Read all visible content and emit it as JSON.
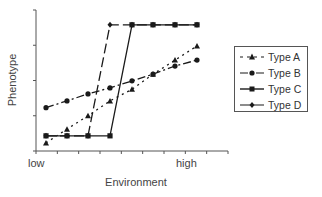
{
  "chart_data": {
    "type": "line",
    "title": "",
    "xlabel": "Environment",
    "ylabel": "Phenotype",
    "x_tick_labels": [
      "low",
      "high"
    ],
    "x": [
      1,
      2,
      3,
      4,
      5,
      6,
      7,
      8
    ],
    "ylim": [
      0,
      4
    ],
    "grid": false,
    "legend_position": "right",
    "series": [
      {
        "name": "Type A",
        "marker": "triangle",
        "line_style": "dotted",
        "values": [
          0.23,
          0.62,
          1.0,
          1.42,
          1.75,
          2.18,
          2.58,
          2.98
        ]
      },
      {
        "name": "Type B",
        "marker": "circle",
        "line_style": "dash-dot",
        "values": [
          1.23,
          1.42,
          1.62,
          1.79,
          1.99,
          2.18,
          2.41,
          2.58
        ]
      },
      {
        "name": "Type C",
        "marker": "square",
        "line_style": "solid",
        "values": [
          0.43,
          0.43,
          0.43,
          0.43,
          3.58,
          3.58,
          3.58,
          3.58
        ]
      },
      {
        "name": "Type D",
        "marker": "diamond",
        "line_style": "long-dash",
        "values": [
          0.43,
          0.43,
          0.43,
          3.58,
          3.58,
          3.58,
          3.58,
          3.58
        ]
      }
    ]
  },
  "axes": {
    "xlabel": "Environment",
    "ylabel": "Phenotype",
    "x_low": "low",
    "x_high": "high"
  },
  "legend": {
    "items": [
      {
        "label": "Type A"
      },
      {
        "label": "Type B"
      },
      {
        "label": "Type C"
      },
      {
        "label": "Type D"
      }
    ]
  },
  "colors": {
    "line": "#1a1a1a",
    "axis": "#555555"
  }
}
